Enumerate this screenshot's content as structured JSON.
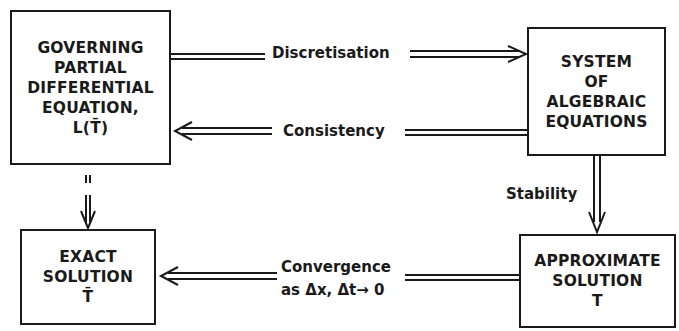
{
  "boxes": {
    "governing": {
      "lines": [
        "GOVERNING",
        "PARTIAL",
        "DIFFERENTIAL",
        "EQUATION,",
        "L(T̄)"
      ]
    },
    "system": {
      "lines": [
        "SYSTEM",
        "OF",
        "ALGEBRAIC",
        "EQUATIONS"
      ]
    },
    "exact": {
      "lines": [
        "EXACT",
        "SOLUTION",
        "T̄"
      ]
    },
    "approximate": {
      "lines": [
        "APPROXIMATE",
        "SOLUTION",
        "T"
      ]
    }
  },
  "arrows": {
    "discretisation": {
      "label": "Discretisation",
      "from": "governing",
      "to": "system"
    },
    "consistency": {
      "label": "Consistency",
      "from": "system",
      "to": "governing"
    },
    "stability": {
      "label": "Stability",
      "from": "system",
      "to": "approximate"
    },
    "convergence": {
      "label_line1": "Convergence",
      "label_line2": "as Δx, Δt→ 0",
      "from": "approximate",
      "to": "exact"
    },
    "equality": {
      "label": "=",
      "from": "governing",
      "to": "exact"
    }
  }
}
